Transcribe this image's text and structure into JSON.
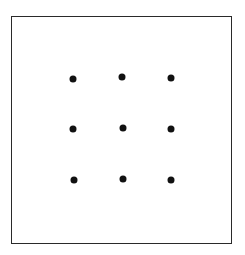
{
  "diagram": {
    "type": "nine-dot-grid",
    "frame": {
      "left": 11,
      "top": 16,
      "right": 232,
      "bottom": 244,
      "stroke": "#2a2a2a"
    },
    "dot_color": "#111111",
    "dots": [
      {
        "row": 1,
        "col": 1,
        "x": 73,
        "y": 79
      },
      {
        "row": 1,
        "col": 2,
        "x": 122,
        "y": 77
      },
      {
        "row": 1,
        "col": 3,
        "x": 171,
        "y": 78
      },
      {
        "row": 2,
        "col": 1,
        "x": 73,
        "y": 129
      },
      {
        "row": 2,
        "col": 2,
        "x": 123,
        "y": 128
      },
      {
        "row": 2,
        "col": 3,
        "x": 171,
        "y": 129
      },
      {
        "row": 3,
        "col": 1,
        "x": 74,
        "y": 180
      },
      {
        "row": 3,
        "col": 2,
        "x": 123,
        "y": 179
      },
      {
        "row": 3,
        "col": 3,
        "x": 171,
        "y": 180
      }
    ]
  }
}
